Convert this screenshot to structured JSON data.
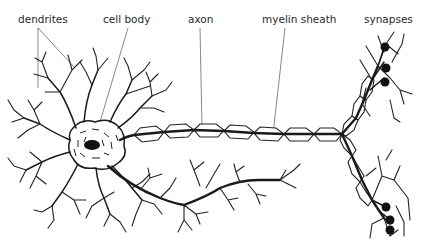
{
  "diagram": {
    "labels": [
      {
        "id": "dendrites",
        "text": "dendrites",
        "x": 18,
        "y": 14
      },
      {
        "id": "cell_body",
        "text": "cell body",
        "x": 103,
        "y": 14
      },
      {
        "id": "axon",
        "text": "axon",
        "x": 188,
        "y": 14
      },
      {
        "id": "myelin_sheath",
        "text": "myelin sheath",
        "x": 262,
        "y": 14
      },
      {
        "id": "synapses",
        "text": "synapses",
        "x": 364,
        "y": 14
      }
    ],
    "colors": {
      "ink": "#1a1a1a",
      "leader": "#555555",
      "background": "#ffffff"
    }
  }
}
